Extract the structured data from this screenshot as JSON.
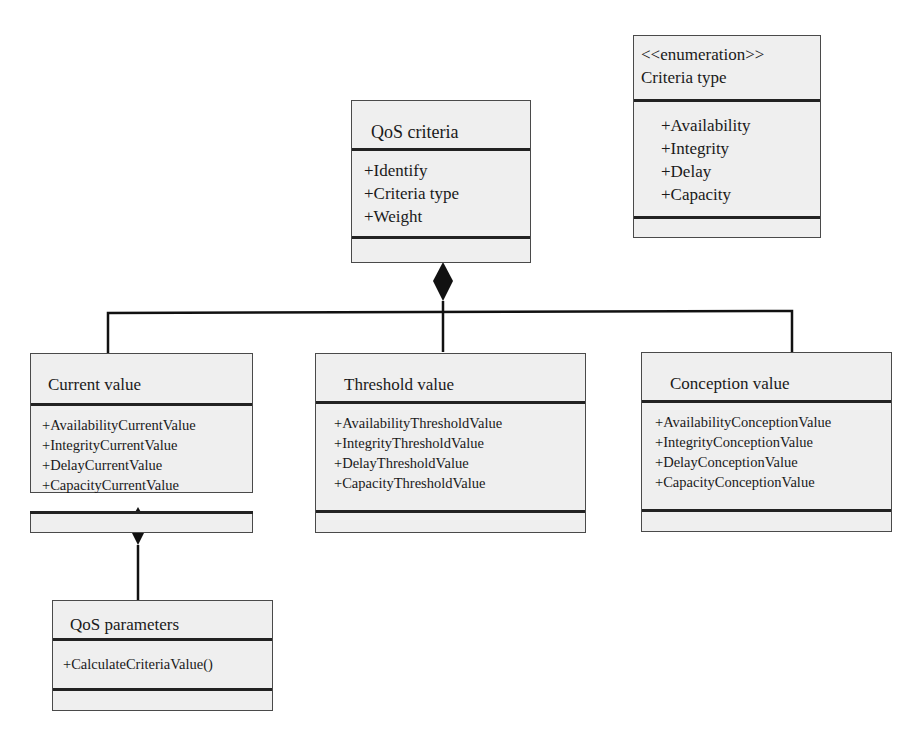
{
  "diagram": {
    "type": "uml-class-diagram",
    "classes": {
      "criteria_type": {
        "stereotype": "<<enumeration>>",
        "name": "Criteria type",
        "attributes": [
          "+Availability",
          "+Integrity",
          "+Delay",
          "+Capacity"
        ],
        "operations": []
      },
      "qos_criteria": {
        "name": "QoS criteria",
        "attributes": [
          "+Identify",
          "+Criteria type",
          "+Weight"
        ],
        "operations": []
      },
      "current_value": {
        "name": "Current value",
        "attributes": [
          "+AvailabilityCurrentValue",
          "+IntegrityCurrentValue",
          "+DelayCurrentValue",
          "+CapacityCurrentValue"
        ],
        "operations": []
      },
      "threshold_value": {
        "name": "Threshold value",
        "attributes": [
          "+AvailabilityThresholdValue",
          "+IntegrityThresholdValue",
          "+DelayThresholdValue",
          "+CapacityThresholdValue"
        ],
        "operations": []
      },
      "conception_value": {
        "name": "Conception value",
        "attributes": [
          "+AvailabilityConceptionValue",
          "+IntegrityConceptionValue",
          "+DelayConceptionValue",
          "+CapacityConceptionValue"
        ],
        "operations": []
      },
      "qos_parameters": {
        "name": "QoS parameters",
        "attributes": [
          "+CalculateCriteriaValue()"
        ],
        "operations": []
      }
    },
    "relationships": [
      {
        "type": "composition",
        "whole": "QoS criteria",
        "part": "Current value"
      },
      {
        "type": "composition",
        "whole": "QoS criteria",
        "part": "Threshold value"
      },
      {
        "type": "composition",
        "whole": "QoS criteria",
        "part": "Conception value"
      },
      {
        "type": "composition",
        "whole": "Current value",
        "part": "QoS parameters"
      }
    ],
    "colors": {
      "box_fill": "#efefef",
      "line": "#111111",
      "background": "#ffffff"
    }
  }
}
